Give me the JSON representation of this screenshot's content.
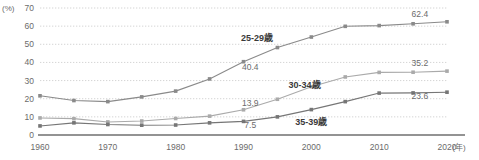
{
  "chart_data": {
    "type": "line",
    "title": "",
    "subtitle": "",
    "xlabel": "(年)",
    "ylabel": "(%)",
    "x": [
      1960,
      1965,
      1970,
      1975,
      1980,
      1985,
      1990,
      1995,
      2000,
      2005,
      2010,
      2015,
      2020
    ],
    "tick_labels_x": [
      "1960",
      "1970",
      "1980",
      "1990",
      "2000",
      "2010",
      "2020"
    ],
    "tick_values_x": [
      1960,
      1970,
      1980,
      1990,
      2000,
      2010,
      2020
    ],
    "tick_labels_y": [
      "0",
      "10",
      "20",
      "30",
      "40",
      "50",
      "60",
      "70"
    ],
    "tick_values_y": [
      0,
      10,
      20,
      30,
      40,
      50,
      60,
      70
    ],
    "xlim": [
      1960,
      2020
    ],
    "ylim": [
      0,
      70
    ],
    "grid": true,
    "grid_style": "dotted-horizontal",
    "legend": "inline-annotations",
    "series": [
      {
        "name": "25-29歳",
        "color": "#8a8a8a",
        "label_text": "25-29歳",
        "end_label": "62.4",
        "mid_label": "40.4",
        "values": [
          21.6,
          19.0,
          18.4,
          21.0,
          24.2,
          30.9,
          40.4,
          48.2,
          54.0,
          59.9,
          60.3,
          61.3,
          62.4
        ]
      },
      {
        "name": "30-34歳",
        "color": "#aaaaaa",
        "label_text": "30-34歳",
        "end_label": "35.2",
        "mid_label": "13.9",
        "values": [
          9.4,
          9.0,
          7.2,
          7.7,
          9.1,
          10.4,
          13.9,
          19.7,
          26.6,
          32.0,
          34.5,
          34.6,
          35.2
        ]
      },
      {
        "name": "35-39歳",
        "color": "#767676",
        "label_text": "35-39歳",
        "end_label": "23.6",
        "mid_label": "7.5",
        "values": [
          5.0,
          6.7,
          5.8,
          5.4,
          5.5,
          6.7,
          7.5,
          10.0,
          14.0,
          18.4,
          23.1,
          23.2,
          23.6
        ]
      }
    ],
    "annotations": [
      {
        "text": "25-29歳",
        "x": 1992,
        "y": 52
      },
      {
        "text": "30-34歳",
        "x": 1999,
        "y": 26
      },
      {
        "text": "35-39歳",
        "x": 2000,
        "y": 5.5
      },
      {
        "text": "40.4",
        "x": 1991,
        "y": 36
      },
      {
        "text": "13.9",
        "x": 1991,
        "y": 16
      },
      {
        "text": "7.5",
        "x": 1991,
        "y": 4
      },
      {
        "text": "62.4",
        "x": 2016,
        "y": 65
      },
      {
        "text": "35.2",
        "x": 2016,
        "y": 38
      },
      {
        "text": "23.6",
        "x": 2016,
        "y": 20
      }
    ]
  }
}
